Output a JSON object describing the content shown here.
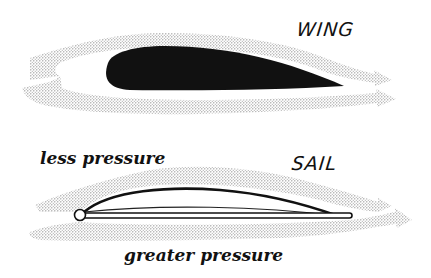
{
  "diagram": {
    "wing": {
      "title": "WING",
      "shape": "solid airfoil",
      "flow": "airflow streams above and below, converging to arrows at trailing edge"
    },
    "sail": {
      "title": "SAIL",
      "shape": "curved sail attached to mast and boom",
      "top_label": "less pressure",
      "bottom_label": "greater pressure",
      "flow": "airflow streams above and below the sail"
    },
    "colors": {
      "ink": "#111111",
      "flow_stipple": "#8c8c8c",
      "background": "#ffffff"
    }
  }
}
